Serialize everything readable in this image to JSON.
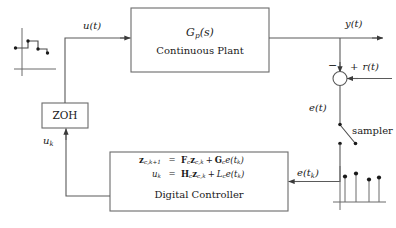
{
  "diagram": {
    "colors": {
      "line": "#5a5a5a",
      "text": "#1a1a1a",
      "background": "#ffffff"
    },
    "blocks": {
      "plant": {
        "transfer_function": "G",
        "tf_sub": "p",
        "tf_arg": "(s)",
        "caption": "Continuous Plant"
      },
      "zoh": {
        "label": "ZOH"
      },
      "controller": {
        "caption": "Digital Controller",
        "equations": [
          {
            "lhs_var": "z",
            "lhs_sub": "c,k+1",
            "relation": "=",
            "rhs": [
              {
                "sym": "F",
                "sub": "c",
                "bold": true
              },
              {
                "sym": "z",
                "sub": "c,k",
                "bold": true
              },
              {
                "op": "+"
              },
              {
                "sym": "G",
                "sub": "c",
                "bold": true
              },
              {
                "sym": "e",
                "arg": "(t",
                "argsub": "k",
                "argclose": ")"
              }
            ]
          },
          {
            "lhs_var": "u",
            "lhs_sub": "k",
            "relation": "=",
            "rhs": [
              {
                "sym": "H",
                "sub": "c",
                "bold": true
              },
              {
                "sym": "z",
                "sub": "c,k",
                "bold": true
              },
              {
                "op": "+"
              },
              {
                "sym": "L",
                "sub": "c",
                "bold": false
              },
              {
                "sym": "e",
                "arg": "(t",
                "argsub": "k",
                "argclose": ")"
              }
            ]
          }
        ]
      }
    },
    "signals": {
      "u_t": {
        "var": "u",
        "arg": "(t)"
      },
      "y_t": {
        "var": "y",
        "arg": "(t)"
      },
      "e_t": {
        "var": "e",
        "arg": "(t)"
      },
      "e_tk": {
        "var": "e",
        "arg": "(t",
        "sub": "k",
        "close": ")"
      },
      "u_k": {
        "var": "u",
        "sub": "k"
      },
      "r_t": {
        "var": "r",
        "arg": "(t)"
      }
    },
    "summing_junction": {
      "negative_sign": "−",
      "positive_sign": "+",
      "reference_label": "r(t)"
    },
    "sampler": {
      "label": "sampler"
    },
    "waveforms": {
      "staircase": {
        "name": "zoh-staircase-waveform",
        "description": "held staircase signal with sample dots"
      },
      "stem": {
        "name": "sampled-signal-stem-plot",
        "description": "discrete sampled sequence",
        "values": [
          0.78,
          0.92,
          0.7,
          0.76
        ],
        "count": 4
      }
    }
  }
}
